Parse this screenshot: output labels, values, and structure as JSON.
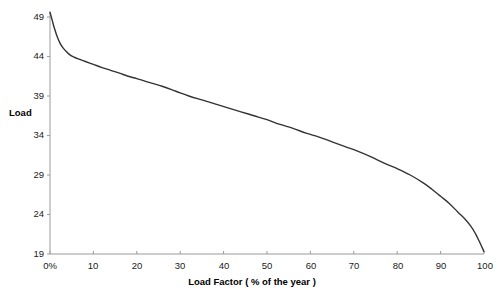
{
  "chart_data": {
    "type": "line",
    "title": "",
    "subtitle": "",
    "xlabel": "Load Factor ( % of the year )",
    "ylabel": "Load",
    "xlim": [
      0,
      100
    ],
    "ylim": [
      19,
      49
    ],
    "grid": false,
    "legend": null,
    "legend_position": "none",
    "x_tick_labels": [
      "0%",
      "10",
      "20",
      "30",
      "40",
      "50",
      "60",
      "70",
      "80",
      "90",
      "100"
    ],
    "x_ticks": [
      0,
      10,
      20,
      30,
      40,
      50,
      60,
      70,
      80,
      90,
      100
    ],
    "y_tick_labels": [
      "19",
      "24",
      "29",
      "34",
      "39",
      "44",
      "49"
    ],
    "y_ticks": [
      19,
      24,
      29,
      34,
      39,
      44,
      49
    ],
    "series": [
      {
        "name": "Load duration curve",
        "color": "#333333",
        "line_width": 1.4,
        "x": [
          0,
          0.5,
          1,
          1.6,
          2.3,
          3,
          3.8,
          4.6,
          5.4,
          6.5,
          8,
          10,
          12,
          14,
          16,
          18,
          20,
          23,
          26,
          29,
          32,
          35,
          38,
          41,
          44,
          47,
          50,
          53,
          56,
          59,
          62,
          65,
          68,
          71,
          74,
          77,
          80,
          83,
          86,
          88,
          90,
          92,
          94,
          95.5,
          97,
          98,
          99,
          99.5,
          100
        ],
        "y": [
          49.6,
          48.6,
          47.6,
          46.6,
          45.7,
          45.1,
          44.6,
          44.2,
          43.95,
          43.7,
          43.4,
          43.0,
          42.6,
          42.25,
          41.9,
          41.5,
          41.2,
          40.7,
          40.2,
          39.6,
          39.0,
          38.5,
          38.0,
          37.5,
          37.0,
          36.5,
          36.0,
          35.4,
          34.9,
          34.3,
          33.8,
          33.2,
          32.6,
          32.0,
          31.3,
          30.5,
          29.8,
          29.0,
          28.0,
          27.2,
          26.3,
          25.4,
          24.3,
          23.5,
          22.5,
          21.6,
          20.5,
          19.9,
          19.3
        ]
      }
    ]
  },
  "axis": {
    "y_title": "Load",
    "x_title": "Load Factor ( % of the year )"
  },
  "ticks": {
    "y": [
      "49",
      "44",
      "39",
      "34",
      "29",
      "24",
      "19"
    ],
    "x": [
      "0%",
      "10",
      "20",
      "30",
      "40",
      "50",
      "60",
      "70",
      "80",
      "90",
      "100"
    ]
  },
  "style": {
    "line_color": "#333333",
    "axis_color": "#808080",
    "text_color": "#1a1a1a",
    "background": "#ffffff"
  }
}
